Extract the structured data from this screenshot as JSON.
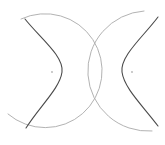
{
  "diagram": {
    "colors": {
      "background": "#ffffff",
      "circle_stroke": "#a9a9a9",
      "hyperbola_stroke": "#4a4a4a",
      "focus_dot": "#b5b5b5"
    },
    "elements": {
      "circles": [
        {
          "name": "left-circle"
        },
        {
          "name": "right-circle"
        }
      ],
      "hyperbola_branches": [
        {
          "name": "left-branch"
        },
        {
          "name": "right-branch"
        }
      ],
      "foci": [
        {
          "name": "left-focus"
        },
        {
          "name": "right-focus"
        }
      ]
    }
  }
}
